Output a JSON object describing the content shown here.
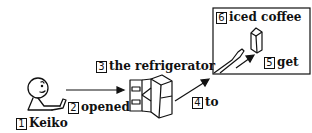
{
  "diagram": {
    "labels": [
      {
        "num": "1",
        "text": "Keiko"
      },
      {
        "num": "2",
        "text": "opened"
      },
      {
        "num": "3",
        "text": "the refrigerator"
      },
      {
        "num": "4",
        "text": "to"
      },
      {
        "num": "5",
        "text": "get"
      },
      {
        "num": "6",
        "text": "iced coffee"
      }
    ]
  }
}
